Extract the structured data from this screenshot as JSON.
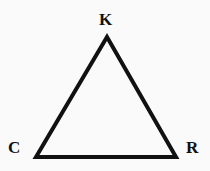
{
  "figure": {
    "type": "triangle-diagram",
    "background_color": "#fafafa",
    "stroke_color": "#111111",
    "stroke_width": 4,
    "fill_color": "none",
    "labels": {
      "apex": "K",
      "bottom_left": "C",
      "bottom_right": "R"
    },
    "vertices": {
      "apex": {
        "x": 107,
        "y": 37
      },
      "bottom_left": {
        "x": 36,
        "y": 157
      },
      "bottom_right": {
        "x": 176,
        "y": 157
      }
    },
    "polygon_points": "107,37 176,157 36,157"
  }
}
